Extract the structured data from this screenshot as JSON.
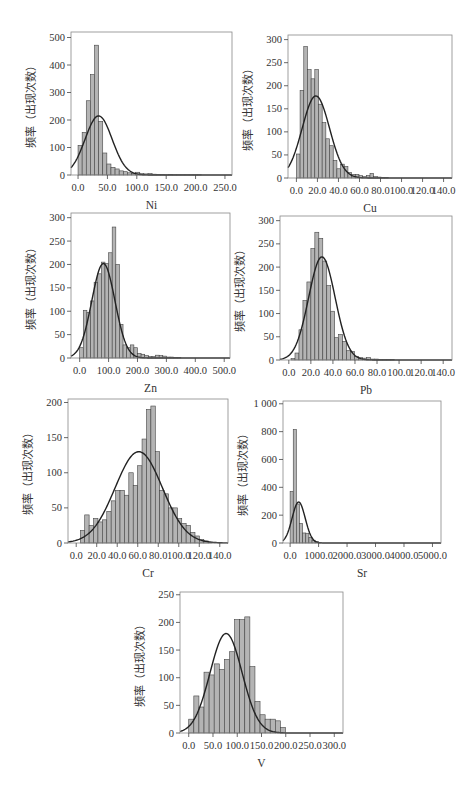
{
  "figure": {
    "ylabel": "频率（出现次数）"
  },
  "chart_data": [
    {
      "id": "ni",
      "type": "bar",
      "title": "",
      "xlabel": "Ni",
      "ylabel": "频率（出现次数）",
      "frame": {
        "x": 71,
        "y": 32,
        "w": 161,
        "h": 143
      },
      "xlim": [
        -12,
        262
      ],
      "ylim": [
        0,
        520
      ],
      "xticks": [
        0,
        50,
        100,
        150,
        200,
        250
      ],
      "xtick_labels": [
        "0.0",
        "50.0",
        "100.0",
        "150.0",
        "200.0",
        "250.0"
      ],
      "yticks": [
        0,
        100,
        200,
        300,
        400,
        500
      ],
      "ytick_labels": [
        "0",
        "100",
        "200",
        "300",
        "400",
        "500"
      ],
      "bin_start": 0,
      "bin_width": 7,
      "values": [
        108,
        155,
        270,
        365,
        472,
        195,
        80,
        40,
        28,
        22,
        15,
        12,
        8,
        6,
        10,
        5,
        4,
        5,
        3,
        2,
        2,
        1,
        2,
        1,
        1,
        1,
        1,
        1,
        1,
        1
      ],
      "normal_fit": {
        "mean": 35,
        "sd": 23,
        "peak": 215
      },
      "grid": false,
      "legend": null
    },
    {
      "id": "cu",
      "type": "bar",
      "title": "",
      "xlabel": "Cu",
      "ylabel": "频率（出现次数）",
      "frame": {
        "x": 288,
        "y": 35,
        "w": 164,
        "h": 143
      },
      "xlim": [
        -8,
        148
      ],
      "ylim": [
        0,
        310
      ],
      "xticks": [
        0,
        20,
        40,
        60,
        80,
        100,
        120,
        140
      ],
      "xtick_labels": [
        "0.0",
        "20.0",
        "40.0",
        "60.0",
        "80.0",
        "100.0",
        "120.0",
        "140.0"
      ],
      "yticks": [
        0,
        50,
        100,
        150,
        200,
        250,
        300
      ],
      "ytick_labels": [
        "0",
        "50",
        "100",
        "150",
        "200",
        "250",
        "300"
      ],
      "bin_start": 0,
      "bin_width": 3.5,
      "values": [
        52,
        190,
        285,
        235,
        215,
        235,
        160,
        120,
        85,
        70,
        38,
        20,
        30,
        25,
        12,
        8,
        8,
        5,
        3,
        5,
        10,
        3,
        2,
        1,
        1
      ],
      "normal_fit": {
        "mean": 18.5,
        "sd": 13,
        "peak": 178
      },
      "grid": false,
      "legend": null
    },
    {
      "id": "zn",
      "type": "bar",
      "title": "",
      "xlabel": "Zn",
      "ylabel": "频率（出现次数）",
      "frame": {
        "x": 71,
        "y": 213,
        "w": 159,
        "h": 145
      },
      "xlim": [
        -30,
        520
      ],
      "ylim": [
        0,
        310
      ],
      "xticks": [
        0,
        100,
        200,
        300,
        400,
        500
      ],
      "xtick_labels": [
        "0.0",
        "100.0",
        "200.0",
        "300.0",
        "400.0",
        "500.0"
      ],
      "yticks": [
        0,
        50,
        100,
        150,
        200,
        250,
        300
      ],
      "ytick_labels": [
        "0",
        "50",
        "100",
        "150",
        "200",
        "250",
        "300"
      ],
      "bin_start": 0,
      "bin_width": 12.5,
      "values": [
        22,
        102,
        97,
        122,
        162,
        180,
        205,
        202,
        225,
        280,
        200,
        72,
        28,
        22,
        28,
        22,
        10,
        8,
        5,
        3,
        3,
        6,
        5,
        4,
        2,
        2,
        1,
        1
      ],
      "normal_fit": {
        "mean": 82,
        "sd": 40,
        "peak": 202
      },
      "grid": false,
      "legend": null
    },
    {
      "id": "pb",
      "type": "bar",
      "title": "",
      "xlabel": "Pb",
      "ylabel": "频率（出现次数）",
      "frame": {
        "x": 280,
        "y": 216,
        "w": 172,
        "h": 144
      },
      "xlim": [
        -8,
        148
      ],
      "ylim": [
        0,
        310
      ],
      "xticks": [
        0,
        20,
        40,
        60,
        80,
        100,
        120,
        140
      ],
      "xtick_labels": [
        "0.0",
        "20.0",
        "40.0",
        "60.0",
        "80.0",
        "100.0",
        "120.0",
        "140.0"
      ],
      "yticks": [
        0,
        50,
        100,
        150,
        200,
        250,
        300
      ],
      "ytick_labels": [
        "0",
        "50",
        "100",
        "150",
        "200",
        "250",
        "300"
      ],
      "bin_start": 2,
      "bin_width": 3.6,
      "values": [
        3,
        15,
        65,
        128,
        168,
        240,
        275,
        262,
        213,
        160,
        105,
        48,
        55,
        40,
        20,
        18,
        8,
        5,
        4,
        5,
        2,
        2,
        1,
        1,
        1,
        1
      ],
      "normal_fit": {
        "mean": 30,
        "sd": 12,
        "peak": 222
      },
      "grid": false,
      "legend": null
    },
    {
      "id": "cr",
      "type": "bar",
      "title": "",
      "xlabel": "Cr",
      "ylabel": "频率（出现次数）",
      "frame": {
        "x": 68,
        "y": 399,
        "w": 160,
        "h": 144
      },
      "xlim": [
        -8,
        148
      ],
      "ylim": [
        0,
        205
      ],
      "xticks": [
        0,
        20,
        40,
        60,
        80,
        100,
        120,
        140
      ],
      "xtick_labels": [
        "0.0",
        "20.0",
        "40.0",
        "60.0",
        "80.0",
        "100.0",
        "120.0",
        "140.0"
      ],
      "yticks": [
        0,
        50,
        100,
        150,
        200
      ],
      "ytick_labels": [
        "0",
        "50",
        "100",
        "150",
        "200"
      ],
      "bin_start": 4,
      "bin_width": 4.3,
      "values": [
        18,
        40,
        25,
        35,
        30,
        33,
        45,
        60,
        75,
        75,
        68,
        100,
        82,
        110,
        148,
        190,
        195,
        130,
        75,
        70,
        50,
        50,
        35,
        28,
        25,
        15,
        10,
        5,
        3,
        1
      ],
      "normal_fit": {
        "mean": 61,
        "sd": 23,
        "peak": 130
      },
      "grid": false,
      "legend": null
    },
    {
      "id": "sr",
      "type": "bar",
      "title": "",
      "xlabel": "Sr",
      "ylabel": "频率（出现次数）",
      "frame": {
        "x": 283,
        "y": 401,
        "w": 158,
        "h": 142
      },
      "xlim": [
        -250,
        5300
      ],
      "ylim": [
        0,
        1020
      ],
      "xticks": [
        0,
        1000,
        2000,
        3000,
        4000,
        5000
      ],
      "xtick_labels": [
        "0.0",
        "1000.0",
        "2000.0",
        "3000.0",
        "4000.0",
        "5000.0"
      ],
      "yticks": [
        0,
        200,
        400,
        600,
        800,
        1000
      ],
      "ytick_labels": [
        "0",
        "200",
        "400",
        "600",
        "800",
        "1 000"
      ],
      "bin_start": 0,
      "bin_width": 110,
      "values": [
        370,
        815,
        280,
        140,
        72,
        70,
        40,
        20,
        12,
        5
      ],
      "normal_fit": {
        "mean": 300,
        "sd": 230,
        "peak": 295
      },
      "grid": false,
      "legend": null
    },
    {
      "id": "v",
      "type": "bar",
      "title": "",
      "xlabel": "V",
      "ylabel": "频率（出现次数）",
      "frame": {
        "x": 180,
        "y": 592,
        "w": 163,
        "h": 141
      },
      "xlim": [
        -18,
        318
      ],
      "ylim": [
        0,
        255
      ],
      "xticks": [
        0,
        50,
        100,
        150,
        200,
        250,
        300
      ],
      "xtick_labels": [
        "0.0",
        "50.0",
        "100.0",
        "150.0",
        "200.0",
        "250.0",
        "300.0"
      ],
      "yticks": [
        0,
        50,
        100,
        150,
        200,
        250
      ],
      "ytick_labels": [
        "0",
        "50",
        "100",
        "150",
        "200",
        "250"
      ],
      "bin_start": 0,
      "bin_width": 10.5,
      "values": [
        25,
        67,
        47,
        110,
        105,
        125,
        115,
        133,
        147,
        205,
        205,
        210,
        120,
        57,
        33,
        25,
        25,
        22,
        10
      ],
      "normal_fit": {
        "mean": 77,
        "sd": 33,
        "peak": 180
      },
      "grid": false,
      "legend": null
    }
  ]
}
